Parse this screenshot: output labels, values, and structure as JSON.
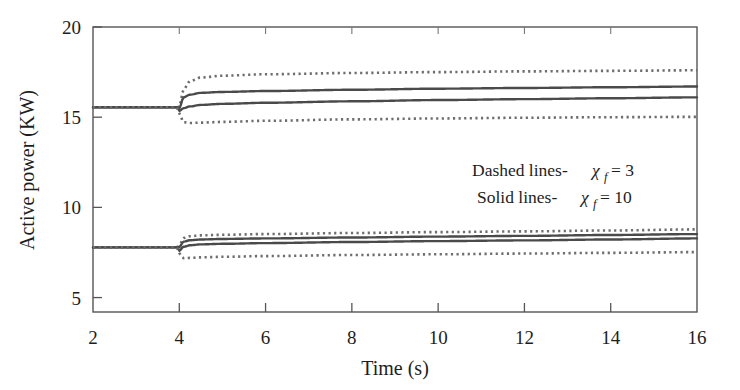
{
  "figure": {
    "background_color": "#ffffff",
    "frame_color": "#555555",
    "curve_color_solid": "#4a4a4a",
    "curve_color_dotted": "#6e6e6e"
  },
  "axes": {
    "x_title": "Time (s)",
    "y_title": "Active power (KW)",
    "x_ticks": [
      "2",
      "4",
      "6",
      "8",
      "10",
      "12",
      "14",
      "16"
    ],
    "y_ticks": [
      "5",
      "10",
      "15",
      "20"
    ]
  },
  "annotations": {
    "dashed_prefix": "Dashed lines-",
    "dashed_symbol": "χ",
    "dashed_subscript": "f",
    "dashed_equals": "= 3",
    "solid_prefix": "Solid lines-",
    "solid_symbol": "χ",
    "solid_subscript": "f",
    "solid_equals": "= 10"
  },
  "chart_data": {
    "type": "line",
    "title": "",
    "xlabel": "Time (s)",
    "ylabel": "Active power (KW)",
    "xlim": [
      2,
      16
    ],
    "ylim": [
      4.2,
      20
    ],
    "x_ticks": [
      2,
      4,
      6,
      8,
      10,
      12,
      14,
      16
    ],
    "y_ticks": [
      5,
      10,
      15,
      20
    ],
    "grid": false,
    "legend_position": "inside-right-middle",
    "step_time": 4,
    "legend_entries": [
      "Dashed lines- χf = 3",
      "Solid lines- χf = 10"
    ],
    "series": [
      {
        "name": "Upper cluster - dotted upper (chi_f = 3)",
        "style": "dotted",
        "group": "upper",
        "x": [
          2,
          3.5,
          3.95,
          4.0,
          4.1,
          4.25,
          4.5,
          5,
          6,
          8,
          10,
          12,
          14,
          16
        ],
        "values": [
          15.55,
          15.55,
          15.55,
          15.6,
          16.55,
          17.0,
          17.2,
          17.3,
          17.38,
          17.45,
          17.5,
          17.54,
          17.57,
          17.6
        ]
      },
      {
        "name": "Upper cluster - solid upper (chi_f = 10)",
        "style": "solid",
        "group": "upper",
        "x": [
          2,
          3.5,
          3.95,
          4.0,
          4.1,
          4.25,
          4.5,
          5,
          6,
          8,
          10,
          12,
          14,
          16
        ],
        "values": [
          15.55,
          15.55,
          15.55,
          15.5,
          16.1,
          16.25,
          16.35,
          16.4,
          16.45,
          16.52,
          16.58,
          16.62,
          16.66,
          16.7
        ]
      },
      {
        "name": "Upper cluster - solid lower (chi_f = 10)",
        "style": "solid",
        "group": "upper",
        "x": [
          2,
          3.5,
          3.95,
          4.0,
          4.1,
          4.25,
          4.5,
          5,
          6,
          8,
          10,
          12,
          14,
          16
        ],
        "values": [
          15.55,
          15.55,
          15.55,
          15.35,
          15.5,
          15.6,
          15.68,
          15.74,
          15.8,
          15.88,
          15.95,
          16.0,
          16.05,
          16.1
        ]
      },
      {
        "name": "Upper cluster - dotted lower (chi_f = 3)",
        "style": "dotted",
        "group": "upper",
        "x": [
          2,
          3.5,
          3.95,
          4.0,
          4.1,
          4.25,
          4.5,
          5,
          6,
          8,
          10,
          12,
          14,
          16
        ],
        "values": [
          15.55,
          15.55,
          15.55,
          15.2,
          14.72,
          14.68,
          14.7,
          14.74,
          14.8,
          14.88,
          14.93,
          14.97,
          15.0,
          15.02
        ]
      },
      {
        "name": "Lower cluster - dotted upper (chi_f = 3)",
        "style": "dotted",
        "group": "lower",
        "x": [
          2,
          3.5,
          3.95,
          4.0,
          4.1,
          4.25,
          4.5,
          5,
          6,
          8,
          10,
          12,
          14,
          16
        ],
        "values": [
          7.78,
          7.78,
          7.78,
          7.9,
          8.3,
          8.4,
          8.45,
          8.48,
          8.52,
          8.58,
          8.63,
          8.67,
          8.72,
          8.78
        ]
      },
      {
        "name": "Lower cluster - solid upper (chi_f = 10)",
        "style": "solid",
        "group": "lower",
        "x": [
          2,
          3.5,
          3.95,
          4.0,
          4.1,
          4.25,
          4.5,
          5,
          6,
          8,
          10,
          12,
          14,
          16
        ],
        "values": [
          7.78,
          7.78,
          7.78,
          7.8,
          8.1,
          8.18,
          8.22,
          8.25,
          8.28,
          8.33,
          8.38,
          8.42,
          8.47,
          8.52
        ]
      },
      {
        "name": "Lower cluster - solid lower (chi_f = 10)",
        "style": "solid",
        "group": "lower",
        "x": [
          2,
          3.5,
          3.95,
          4.0,
          4.1,
          4.25,
          4.5,
          5,
          6,
          8,
          10,
          12,
          14,
          16
        ],
        "values": [
          7.78,
          7.78,
          7.78,
          7.6,
          7.82,
          7.9,
          7.95,
          7.98,
          8.02,
          8.08,
          8.13,
          8.17,
          8.22,
          8.28
        ]
      },
      {
        "name": "Lower cluster - dotted lower (chi_f = 3)",
        "style": "dotted",
        "group": "lower",
        "x": [
          2,
          3.5,
          3.95,
          4.0,
          4.1,
          4.25,
          4.5,
          5,
          6,
          8,
          10,
          12,
          14,
          16
        ],
        "values": [
          7.78,
          7.78,
          7.78,
          7.45,
          7.18,
          7.2,
          7.23,
          7.26,
          7.3,
          7.36,
          7.4,
          7.44,
          7.48,
          7.52
        ]
      }
    ]
  }
}
